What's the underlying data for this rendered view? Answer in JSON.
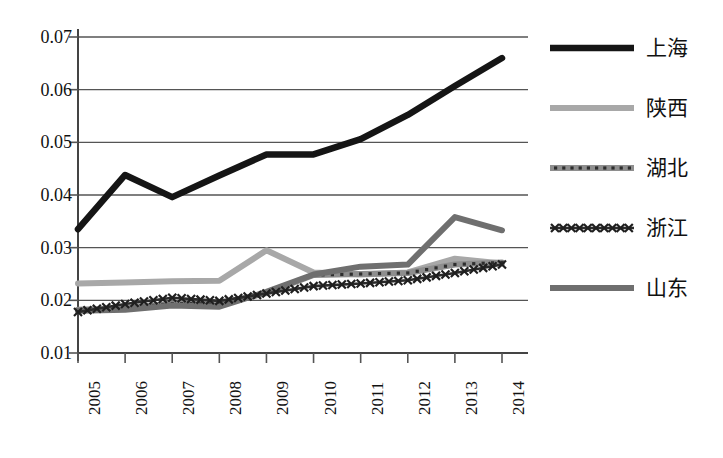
{
  "chart_data": {
    "type": "line",
    "title": "",
    "xlabel": "",
    "ylabel": "",
    "x": [
      "2005",
      "2006",
      "2007",
      "2008",
      "2009",
      "2010",
      "2011",
      "2012",
      "2013",
      "2014"
    ],
    "categories": [
      "2005",
      "2006",
      "2007",
      "2008",
      "2009",
      "2010",
      "2011",
      "2012",
      "2013",
      "2014"
    ],
    "ylim": [
      0.01,
      0.07
    ],
    "yticks": [
      "0.01",
      "0.02",
      "0.03",
      "0.04",
      "0.05",
      "0.06",
      "0.07"
    ],
    "ytick_values": [
      0.01,
      0.02,
      0.03,
      0.04,
      0.05,
      0.06,
      0.07
    ],
    "grid": true,
    "legend_position": "right",
    "series": [
      {
        "name": "上海",
        "color": "#151515",
        "style": "solid-thick",
        "values": [
          0.0335,
          0.0438,
          0.0396,
          0.0437,
          0.0477,
          0.0477,
          0.0506,
          0.0552,
          0.0607,
          0.066
        ]
      },
      {
        "name": "陕西",
        "color": "#a8a8a8",
        "style": "solid-light",
        "values": [
          0.0232,
          0.0234,
          0.0236,
          0.0237,
          0.0295,
          0.0253,
          0.0249,
          0.0253,
          0.0279,
          0.027
        ]
      },
      {
        "name": "湖北",
        "color": "#8e8e8e",
        "style": "dotted-marker",
        "values": [
          0.0182,
          0.0185,
          0.0194,
          0.0193,
          0.0214,
          0.0248,
          0.025,
          0.0252,
          0.0268,
          0.0272
        ]
      },
      {
        "name": "浙江",
        "color": "#2b2b2b",
        "style": "x-marker",
        "values": [
          0.0178,
          0.0193,
          0.0205,
          0.0199,
          0.0213,
          0.0227,
          0.0232,
          0.0238,
          0.0252,
          0.0268
        ]
      },
      {
        "name": "山东",
        "color": "#6f6f6f",
        "style": "solid-medium",
        "values": [
          0.018,
          0.0182,
          0.019,
          0.0188,
          0.0216,
          0.0249,
          0.0264,
          0.0268,
          0.0358,
          0.0333
        ]
      }
    ]
  },
  "legend": {
    "items": [
      {
        "label": "上海"
      },
      {
        "label": "陕西"
      },
      {
        "label": "湖北"
      },
      {
        "label": "浙江"
      },
      {
        "label": "山东"
      }
    ]
  },
  "caption": {
    "text": ""
  }
}
